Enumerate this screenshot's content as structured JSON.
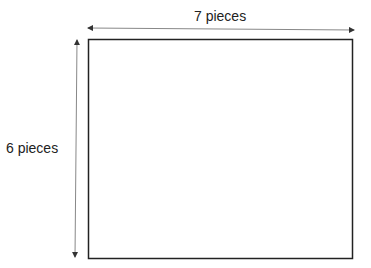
{
  "diagram": {
    "width_label": "7 pieces",
    "height_label": "6 pieces",
    "width_pieces": 7,
    "height_pieces": 6,
    "colors": {
      "rect_stroke": "#222222",
      "arrow": "#555555",
      "text": "#222222"
    }
  }
}
